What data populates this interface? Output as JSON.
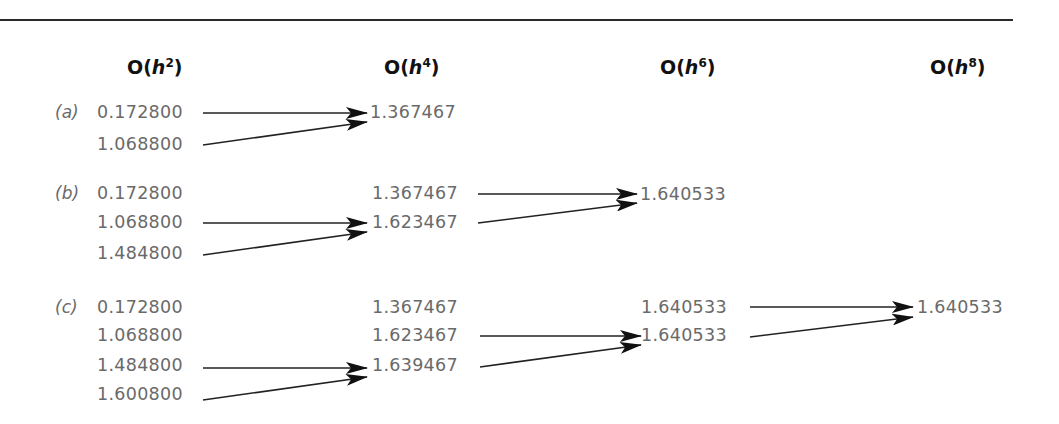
{
  "columns": [
    {
      "base": "O(",
      "var": "h",
      "exp": "2",
      "close": ")",
      "x": 127
    },
    {
      "base": "O(",
      "var": "h",
      "exp": "4",
      "close": ")",
      "x": 384
    },
    {
      "base": "O(",
      "var": "h",
      "exp": "6",
      "close": ")",
      "x": 660
    },
    {
      "base": "O(",
      "var": "h",
      "exp": "8",
      "close": ")",
      "x": 930
    }
  ],
  "rows": [
    {
      "label": "(a)",
      "h2": [
        "0.172800",
        "1.068800"
      ],
      "h4": [
        "1.367467"
      ],
      "h6": [],
      "h8": []
    },
    {
      "label": "(b)",
      "h2": [
        "0.172800",
        "1.068800",
        "1.484800"
      ],
      "h4": [
        "1.367467",
        "1.623467"
      ],
      "h6": [
        "1.640533"
      ],
      "h8": []
    },
    {
      "label": "(c)",
      "h2": [
        "0.172800",
        "1.068800",
        "1.484800",
        "1.600800"
      ],
      "h4": [
        "1.367467",
        "1.623467",
        "1.639467"
      ],
      "h6": [
        "1.640533",
        "1.640533"
      ],
      "h8": [
        "1.640533"
      ]
    }
  ],
  "colors": {
    "text": "#6a6a6a",
    "header": "#111111",
    "rule": "#2a2a2a",
    "arrow": "#111111"
  }
}
